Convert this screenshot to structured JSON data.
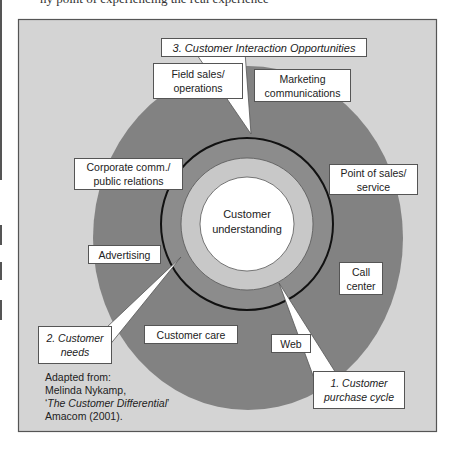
{
  "top_text": "ny point of experiencing the real experience",
  "colors": {
    "frame_bg": "#d4d4d4",
    "frame_border": "#555555",
    "outer_ring": "#828282",
    "mid_ring": "#8e8e8e",
    "light_ring": "#c8c8c8",
    "core": "#ffffff",
    "ring_line": "#111111"
  },
  "core": {
    "line1": "Customer",
    "line2": "understanding"
  },
  "callouts": {
    "interaction": "3. Customer Interaction Opportunities",
    "needs_line1": "2. Customer",
    "needs_line2": "needs",
    "purchase_line1": "1. Customer",
    "purchase_line2": "purchase cycle"
  },
  "channels": [
    {
      "id": "field-sales",
      "line1": "Field sales/",
      "line2": "operations"
    },
    {
      "id": "marketing",
      "line1": "Marketing",
      "line2": "communications"
    },
    {
      "id": "corporate",
      "line1": "Corporate comm./",
      "line2": "public relations"
    },
    {
      "id": "point-of-sales",
      "line1": "Point of sales/",
      "line2": "service"
    },
    {
      "id": "advertising",
      "line1": "Advertising",
      "line2": ""
    },
    {
      "id": "call-center",
      "line1": "Call",
      "line2": "center"
    },
    {
      "id": "customer-care",
      "line1": "Customer care",
      "line2": ""
    },
    {
      "id": "web",
      "line1": "Web",
      "line2": ""
    }
  ],
  "source": {
    "line1": "Adapted from:",
    "line2": "Melinda Nykamp,",
    "line3_open": "‘",
    "line3_title": "The Customer Differential",
    "line3_close": "’",
    "line4": "Amacom (2001)."
  }
}
